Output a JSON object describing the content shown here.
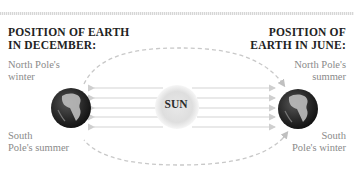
{
  "left": {
    "title_line1": "POSITION OF EARTH",
    "title_line2": "IN DECEMBER:",
    "top_label_line1": "North Pole's",
    "top_label_line2": "winter",
    "bottom_label_line1": "South",
    "bottom_label_line2": "Pole's summer"
  },
  "right": {
    "title_line1": "POSITION OF",
    "title_line2": "EARTH IN JUNE:",
    "top_label_line1": "North Pole's",
    "top_label_line2": "summer",
    "bottom_label_line1": "South",
    "bottom_label_line2": "Pole's winter"
  },
  "sun": {
    "label": "SUN"
  },
  "colors": {
    "orbit": "#c8c8c8",
    "rays": "#d4d4d4",
    "sun": "#e2e2e2",
    "earth": "#2e2e2e",
    "land": "#bdbdbd"
  }
}
